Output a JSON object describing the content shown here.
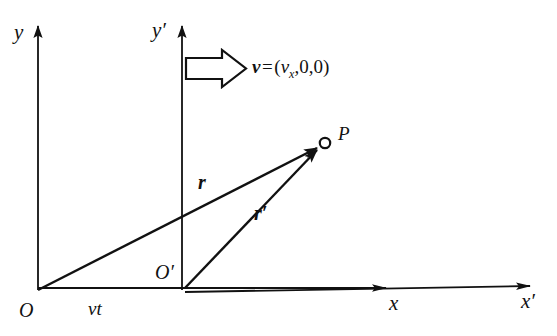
{
  "figure": {
    "background": "#ffffff",
    "ink_color": "#111111",
    "width": 557,
    "height": 336
  },
  "axes": {
    "y_label": "y",
    "y_prime_label": "y′",
    "x_label": "x",
    "x_prime_label": "x′"
  },
  "origins": {
    "o_label": "O",
    "o_prime_label": "O′"
  },
  "point": {
    "p_label": "P"
  },
  "vectors": {
    "r_label": "r",
    "r_prime_label": "r′"
  },
  "displacement": {
    "vt_label": "vt"
  },
  "velocity": {
    "symbol": "v",
    "equals": "=",
    "open_paren": "(",
    "component_x": "v",
    "component_x_sub": "x",
    "comma1": ",",
    "zero1": "0",
    "comma2": ",",
    "zero2": "0",
    "close_paren": ")",
    "full_text": "v = (v_x, 0, 0)"
  },
  "geometry": {
    "origin_o": [
      38,
      290
    ],
    "origin_o_prime": [
      185,
      288
    ],
    "point_p": [
      325,
      143
    ],
    "y_axis_x": 38,
    "y_prime_axis_x": 182,
    "x_axis_y": 288,
    "x_prime_axis_y": 292,
    "x_axis_tip": [
      395,
      288
    ],
    "x_prime_axis_tip": [
      540,
      285
    ],
    "y_axis_tip": [
      38,
      20
    ],
    "y_prime_axis_tip": [
      182,
      20
    ],
    "velocity_arrow_from": [
      186,
      68
    ],
    "velocity_arrow_to": [
      243,
      68
    ]
  }
}
